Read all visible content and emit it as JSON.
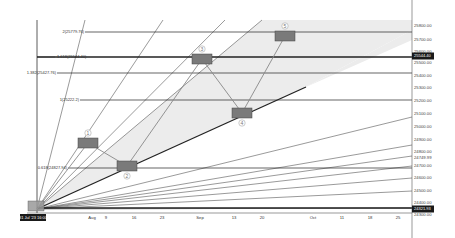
{
  "chart_data": {
    "type": "line",
    "title": "",
    "xlabel": "",
    "ylabel": "",
    "x_ticks": [
      "Aug",
      "9",
      "16",
      "23",
      "Sep",
      "13",
      "20",
      "Oct",
      "11",
      "18",
      "25"
    ],
    "x_tick_positions": [
      92,
      106,
      134,
      162,
      200,
      234,
      262,
      313,
      342,
      370,
      398
    ],
    "y_ticks": [
      "25800.00",
      "25700.00",
      "25600.00",
      "25500.00",
      "25400.00",
      "25300.00",
      "25200.00",
      "25100.00",
      "25000.00",
      "24900.00",
      "24800.00",
      "24749.99",
      "24700.00",
      "24600.00",
      "24500.00",
      "24400.00",
      "24300.00"
    ],
    "y_tick_positions": [
      26,
      40,
      52,
      63,
      76,
      88,
      101,
      114,
      127,
      140,
      152,
      158,
      166,
      178,
      191,
      203,
      215
    ],
    "ylim": [
      24300,
      25850
    ],
    "current_price_tag": {
      "label": "25544.40",
      "y": 56
    },
    "low_price_tag": {
      "label": "24321.93",
      "y": 209
    },
    "date_tag": {
      "label": "31 Jul '23  16:00",
      "x": 33
    },
    "fib_levels": [
      {
        "label": "2(25779.76)",
        "y": 32,
        "x_start": 85,
        "thick": false
      },
      {
        "label": "1.618(25544.40)",
        "y": 57,
        "x_start": 55,
        "thick": true
      },
      {
        "label": "1.382(25427.76)",
        "y": 73,
        "x_start": 57,
        "thick": false
      },
      {
        "label": "1(25222.2)",
        "y": 100,
        "x_start": 80,
        "thick": false
      },
      {
        "label": "0.618(24827.94)",
        "y": 168,
        "x_start": 68,
        "thick": false
      }
    ],
    "elliptic_waves": [
      {
        "label": "1",
        "x": 88,
        "y": 143,
        "label_pos": "above"
      },
      {
        "label": "2",
        "x": 127,
        "y": 166,
        "label_pos": "below"
      },
      {
        "label": "3",
        "x": 202,
        "y": 59,
        "label_pos": "above"
      },
      {
        "label": "4",
        "x": 242,
        "y": 113,
        "label_pos": "below"
      },
      {
        "label": "5",
        "x": 285,
        "y": 36,
        "label_pos": "above"
      }
    ],
    "origin": {
      "x": 37,
      "y": 209
    },
    "trend_line": {
      "x1": 37,
      "y1": 209,
      "x2": 306,
      "y2": 87
    },
    "fan_line_endpoints": [
      [
        85,
        20
      ],
      [
        163,
        20
      ],
      [
        225,
        20
      ],
      [
        262,
        20
      ],
      [
        412,
        117
      ],
      [
        412,
        145
      ],
      [
        412,
        156
      ],
      [
        412,
        166
      ],
      [
        412,
        178
      ],
      [
        412,
        191
      ],
      [
        412,
        208
      ]
    ],
    "legend": []
  },
  "axis": {
    "right_axis_x": 412,
    "bottom_axis_y": 213
  },
  "colors": {
    "background": "#ffffff",
    "line": "#222222",
    "thin_line": "#555555",
    "shade": "#ececec",
    "wave_box": "#7a7a7a",
    "tag_bg": "#1a1a1a"
  }
}
